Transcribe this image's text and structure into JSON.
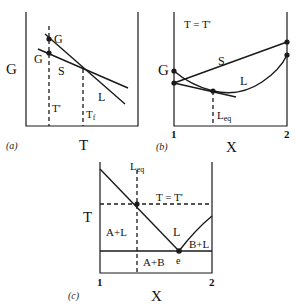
{
  "panels": {
    "a": {
      "caption": "(a)",
      "y_axis_label": "G",
      "x_axis_label": "T",
      "point_labels": {
        "upper": "G",
        "lower": "G"
      },
      "curve_labels": {
        "solid": "S",
        "liquid": "L"
      },
      "markers": {
        "t_prime": "T'",
        "t_f": "Tf",
        "t_f_base": "T",
        "t_f_sub": "f"
      }
    },
    "b": {
      "caption": "(b)",
      "title": "T = T'",
      "y_axis_label": "G",
      "x_axis_label": "X",
      "x_ticks": [
        "1",
        "2"
      ],
      "curve_labels": {
        "solid": "S",
        "liquid": "L"
      },
      "marker": {
        "base": "L",
        "sub": "eq"
      }
    },
    "c": {
      "caption": "(c)",
      "y_axis_label": "T",
      "x_axis_label": "X",
      "x_ticks": [
        "1",
        "2"
      ],
      "isotherm_label": "T = T'",
      "marker": {
        "base": "L",
        "sub": "eq"
      },
      "regions": {
        "a_plus_l": "A+L",
        "liquid": "L",
        "b_plus_l": "B+L",
        "a_plus_b": "A+B"
      },
      "eutectic_label": "e"
    }
  },
  "colors": {
    "line": "#1a1a1a",
    "background": "#ffffff"
  }
}
